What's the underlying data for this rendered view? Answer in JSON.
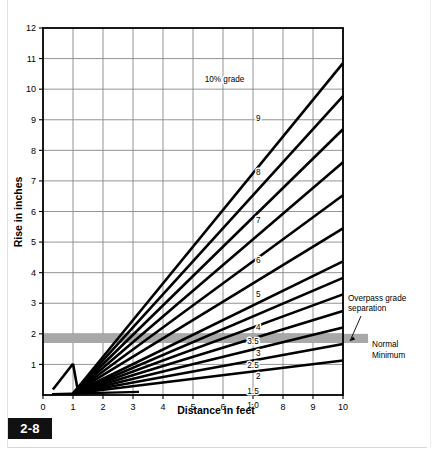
{
  "figure": {
    "number": "2-8"
  },
  "chart_data": {
    "type": "line",
    "title": "",
    "xlabel": "Distance in feet",
    "ylabel": "Rise in inches",
    "xlim": [
      0,
      10
    ],
    "ylim": [
      0,
      12
    ],
    "xticks": [
      "0",
      "1",
      "2",
      "3",
      "4",
      "5",
      "6",
      "7",
      "8",
      "9",
      "10"
    ],
    "yticks": [
      "1",
      "2",
      "3",
      "4",
      "5",
      "6",
      "7",
      "8",
      "9",
      "10",
      "11",
      "12"
    ],
    "grid": true,
    "legend_position": "inline-labels",
    "note": "Each line is rise (inches) vs distance (feet) for a given percent grade; all lines converge near x=1 ft.",
    "series": [
      {
        "name": "10% grade",
        "label": "10% grade",
        "grade_percent": 10,
        "label_x": 6.05,
        "label_y": 10.22,
        "values_at_x10": 12.0
      },
      {
        "name": "9",
        "label": "9",
        "grade_percent": 9,
        "label_x": 7.18,
        "label_y": 8.95,
        "values_at_x10": 10.8
      },
      {
        "name": "8",
        "label": "8",
        "grade_percent": 8,
        "label_x": 7.18,
        "label_y": 7.18,
        "values_at_x10": 9.6
      },
      {
        "name": "7",
        "label": "7",
        "grade_percent": 7,
        "label_x": 7.18,
        "label_y": 5.62,
        "values_at_x10": 8.4
      },
      {
        "name": "6",
        "label": "6",
        "grade_percent": 6,
        "label_x": 7.18,
        "label_y": 4.3,
        "values_at_x10": 7.2
      },
      {
        "name": "5",
        "label": "5",
        "grade_percent": 5,
        "label_x": 7.18,
        "label_y": 3.2,
        "values_at_x10": 6.0
      },
      {
        "name": "4",
        "label": "4",
        "grade_percent": 4,
        "label_x": 7.18,
        "label_y": 2.12,
        "values_at_x10": 4.8
      },
      {
        "name": "3.5",
        "label": "3.5",
        "grade_percent": 3.5,
        "label_x": 7.0,
        "label_y": 1.68,
        "values_at_x10": 4.2
      },
      {
        "name": "3",
        "label": "3",
        "grade_percent": 3,
        "label_x": 7.18,
        "label_y": 1.28,
        "values_at_x10": 3.6
      },
      {
        "name": "2.5",
        "label": "2.5",
        "grade_percent": 2.5,
        "label_x": 7.0,
        "label_y": 0.88,
        "values_at_x10": 3.0
      },
      {
        "name": "2",
        "label": "2",
        "grade_percent": 2,
        "label_x": 7.18,
        "label_y": 0.52,
        "values_at_x10": 2.4
      },
      {
        "name": "1.5",
        "label": "1.5",
        "grade_percent": 1.5,
        "label_x": 7.0,
        "label_y": 0.02,
        "values_at_x10": 1.8
      },
      {
        "name": "1.0",
        "label": "1.0",
        "grade_percent": 1.0,
        "label_x": 7.0,
        "label_y": -0.42,
        "values_at_x10": 1.2
      }
    ],
    "band": {
      "name": "normal-minimum-band",
      "y_from": 1.7,
      "y_to": 2.0,
      "color": "#a8a8a8"
    },
    "annotations": [
      {
        "name": "overpass-grade-separation",
        "text_line1": "Overpass grade",
        "text_line2": "separation"
      },
      {
        "name": "normal-minimum",
        "text_line1": "Normal",
        "text_line2": "Minimum"
      }
    ]
  }
}
